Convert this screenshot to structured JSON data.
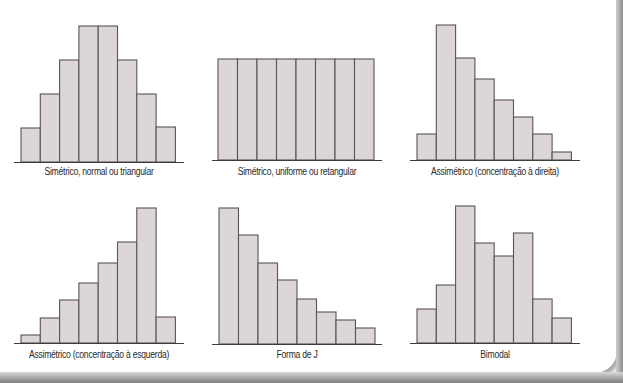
{
  "colors": {
    "bar_fill": "#dcd6da",
    "bar_stroke": "#5a5358",
    "axis": "#3c3c3c",
    "label": "#2b2b2b"
  },
  "chart_data": [
    {
      "type": "bar",
      "title": "Simétrico, normal ou triangular",
      "categories": [
        "1",
        "2",
        "3",
        "4",
        "5",
        "6",
        "7",
        "8"
      ],
      "values": [
        34,
        68,
        102,
        136,
        136,
        102,
        68,
        35
      ],
      "xlabel": "",
      "ylabel": "",
      "grid": false
    },
    {
      "type": "bar",
      "title": "Simétrico, uniforme ou retangular",
      "categories": [
        "1",
        "2",
        "3",
        "4",
        "5",
        "6",
        "7",
        "8"
      ],
      "values": [
        101,
        101,
        101,
        101,
        101,
        101,
        101,
        101
      ],
      "xlabel": "",
      "ylabel": "",
      "grid": false
    },
    {
      "type": "bar",
      "title": "Assimétrico (concentração à direita)",
      "categories": [
        "1",
        "2",
        "3",
        "4",
        "5",
        "6",
        "7",
        "8"
      ],
      "values": [
        26,
        135,
        102,
        81,
        60,
        43,
        26,
        8
      ],
      "xlabel": "",
      "ylabel": "",
      "grid": false
    },
    {
      "type": "bar",
      "title": "Assimétrico (concentração à esquerda)",
      "categories": [
        "1",
        "2",
        "3",
        "4",
        "5",
        "6",
        "7",
        "8"
      ],
      "values": [
        8,
        25,
        43,
        60,
        80,
        101,
        135,
        26
      ],
      "xlabel": "",
      "ylabel": "",
      "grid": false
    },
    {
      "type": "bar",
      "title": "Forma de J",
      "categories": [
        "1",
        "2",
        "3",
        "4",
        "5",
        "6",
        "7",
        "8"
      ],
      "values": [
        136,
        109,
        81,
        64,
        45,
        32,
        24,
        16
      ],
      "xlabel": "",
      "ylabel": "",
      "grid": false
    },
    {
      "type": "bar",
      "title": "Bimodal",
      "categories": [
        "1",
        "2",
        "3",
        "4",
        "5",
        "6",
        "7",
        "8"
      ],
      "values": [
        34,
        58,
        137,
        100,
        87,
        110,
        44,
        25
      ],
      "xlabel": "",
      "ylabel": "",
      "grid": false
    }
  ],
  "layout": [
    {
      "left": 0,
      "top": 0,
      "bar_x": 21,
      "baseline": 162,
      "bar_w": 19.3,
      "axis_x1": 14,
      "axis_x2": 184,
      "label_top": 166
    },
    {
      "left": 200,
      "top": 0,
      "bar_x": 218,
      "baseline": 160,
      "bar_w": 19.5,
      "axis_x1": 212,
      "axis_x2": 382,
      "label_top": 166
    },
    {
      "left": 400,
      "top": 0,
      "bar_x": 417,
      "baseline": 160,
      "bar_w": 19.3,
      "axis_x1": 410,
      "axis_x2": 580,
      "label_top": 166
    },
    {
      "left": 0,
      "top": 0,
      "bar_x": 21,
      "baseline": 343,
      "bar_w": 19.3,
      "axis_x1": 14,
      "axis_x2": 184,
      "label_top": 349
    },
    {
      "left": 200,
      "top": 0,
      "bar_x": 219,
      "baseline": 344,
      "bar_w": 19.5,
      "axis_x1": 212,
      "axis_x2": 382,
      "label_top": 349
    },
    {
      "left": 400,
      "top": 0,
      "bar_x": 417,
      "baseline": 343,
      "bar_w": 19.3,
      "axis_x1": 410,
      "axis_x2": 580,
      "label_top": 349
    }
  ]
}
